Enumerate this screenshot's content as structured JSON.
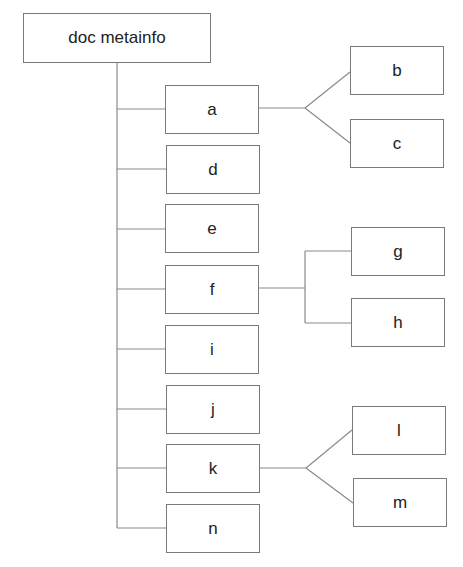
{
  "diagram": {
    "type": "tree",
    "root": {
      "id": "root",
      "label": "doc metainfo"
    },
    "nodes": [
      {
        "id": "a",
        "label": "a",
        "x": 165,
        "y": 85,
        "w": 94,
        "h": 49,
        "children": [
          "b",
          "c"
        ],
        "connector": "fork"
      },
      {
        "id": "d",
        "label": "d",
        "x": 166,
        "y": 145,
        "w": 94,
        "h": 49
      },
      {
        "id": "e",
        "label": "e",
        "x": 165,
        "y": 204,
        "w": 94,
        "h": 49
      },
      {
        "id": "f",
        "label": "f",
        "x": 165,
        "y": 265,
        "w": 94,
        "h": 49,
        "children": [
          "g",
          "h"
        ],
        "connector": "bracket"
      },
      {
        "id": "i",
        "label": "i",
        "x": 165,
        "y": 325,
        "w": 94,
        "h": 49
      },
      {
        "id": "j",
        "label": "j",
        "x": 166,
        "y": 385,
        "w": 94,
        "h": 49
      },
      {
        "id": "k",
        "label": "k",
        "x": 166,
        "y": 444,
        "w": 94,
        "h": 49,
        "children": [
          "l",
          "m"
        ],
        "connector": "fork"
      },
      {
        "id": "n",
        "label": "n",
        "x": 166,
        "y": 504,
        "w": 94,
        "h": 49
      }
    ],
    "leaves": [
      {
        "id": "b",
        "label": "b",
        "x": 350,
        "y": 46,
        "w": 94,
        "h": 49
      },
      {
        "id": "c",
        "label": "c",
        "x": 350,
        "y": 119,
        "w": 94,
        "h": 49
      },
      {
        "id": "g",
        "label": "g",
        "x": 351,
        "y": 227,
        "w": 94,
        "h": 49
      },
      {
        "id": "h",
        "label": "h",
        "x": 351,
        "y": 298,
        "w": 94,
        "h": 49
      },
      {
        "id": "l",
        "label": "l",
        "x": 352,
        "y": 406,
        "w": 94,
        "h": 49
      },
      {
        "id": "m",
        "label": "m",
        "x": 353,
        "y": 478,
        "w": 94,
        "h": 49
      }
    ],
    "colors": {
      "line": "#8a8a8a",
      "border": "#7a7a7a",
      "text": "#222222",
      "background": "#ffffff"
    }
  }
}
